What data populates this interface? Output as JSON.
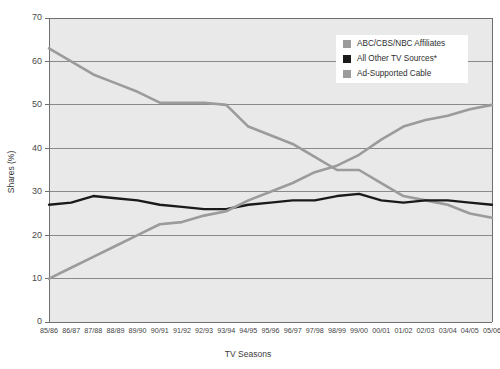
{
  "chart_data": {
    "type": "line",
    "title": "",
    "xlabel": "TV Seasons",
    "ylabel": "Shares (%)",
    "ylim": [
      0,
      70
    ],
    "ytick_step": 10,
    "yticks": [
      0,
      10,
      20,
      30,
      40,
      50,
      60,
      70
    ],
    "grid": true,
    "legend_position": "top-right",
    "categories": [
      "85/86",
      "86/87",
      "87/88",
      "88/89",
      "89/90",
      "90/91",
      "91/92",
      "92/93",
      "93/94",
      "94/95",
      "95/96",
      "96/97",
      "97/98",
      "98/99",
      "99/00",
      "00/01",
      "01/02",
      "02/03",
      "03/04",
      "04/05",
      "05/06"
    ],
    "series": [
      {
        "name": "ABC/CBS/NBC Affiliates",
        "color": "#9b9b9b",
        "values": [
          63,
          60,
          57,
          55,
          53,
          50.5,
          50.5,
          50.5,
          50,
          45,
          43,
          41,
          38,
          35,
          35,
          32,
          29,
          28,
          27,
          25,
          24
        ]
      },
      {
        "name": "All Other TV Sources*",
        "color": "#1a1a1a",
        "values": [
          27,
          27.5,
          29,
          28.5,
          28,
          27,
          26.5,
          26,
          26,
          27,
          27.5,
          28,
          28,
          29,
          29.5,
          28,
          27.5,
          28,
          28,
          27.5,
          27
        ]
      },
      {
        "name": "Ad-Supported Cable",
        "color": "#9b9b9b",
        "values": [
          10,
          12.5,
          15,
          17.5,
          20,
          22.5,
          23,
          24.5,
          25.5,
          28,
          30,
          32,
          34.5,
          36,
          38.5,
          42,
          45,
          46.5,
          47.5,
          49,
          50
        ]
      }
    ],
    "legend": [
      {
        "label": "ABC/CBS/NBC Affiliates",
        "swatch": "#9b9b9b"
      },
      {
        "label": "All Other TV Sources*",
        "swatch": "#1a1a1a"
      },
      {
        "label": "Ad-Supported Cable",
        "swatch": "#9b9b9b"
      }
    ]
  }
}
